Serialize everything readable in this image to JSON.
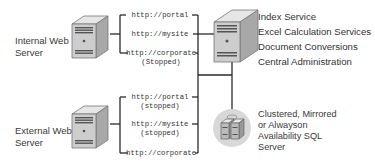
{
  "internal_server": {
    "label_line1": "Internal Web",
    "label_line2": "Server",
    "urls": [
      {
        "url": "http://portal",
        "status": ""
      },
      {
        "url": "http://mysite",
        "status": ""
      },
      {
        "url": "http://corporate",
        "status": "(Stopped)"
      }
    ]
  },
  "external_server": {
    "label_line1": "External Web",
    "label_line2": "Server",
    "urls": [
      {
        "url": "http://portal",
        "status": "(stopped)"
      },
      {
        "url": "http://mysite",
        "status": "(stopped)"
      },
      {
        "url": "http://corporate",
        "status": ""
      }
    ]
  },
  "app_server": {
    "services": [
      "Index Service",
      "Excel Calculation Services",
      "Document Conversions",
      "Central Administration"
    ]
  },
  "sql_server": {
    "label_lines": [
      "Clustered, Mirrored",
      "or Alwayson",
      "Availability SQL",
      "Server"
    ]
  },
  "colors": {
    "line": "#2a2a2a",
    "server_body": "#c8c8c8",
    "server_side": "#9a9a9a",
    "sql_circle": "#d8d8d8"
  }
}
